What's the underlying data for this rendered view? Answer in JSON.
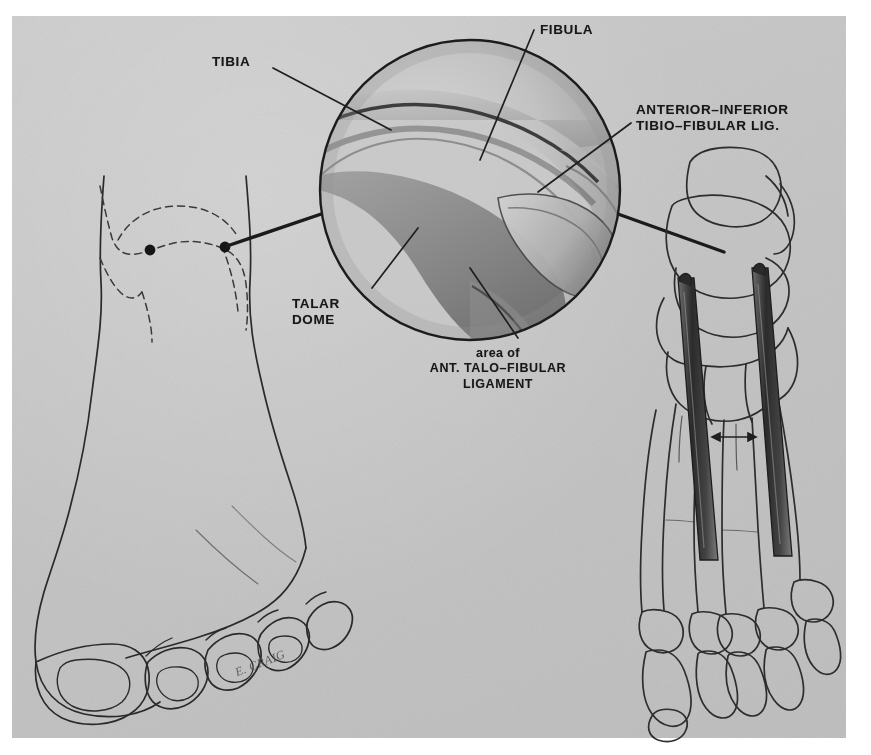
{
  "figure": {
    "kind": "medical-illustration",
    "background_color": "#c6c6c6",
    "page_color": "#ffffff",
    "ink_color": "#171717"
  },
  "labels": {
    "tibia": "TIBIA",
    "fibula": "FIBULA",
    "antinf_line1": "ANTERIOR–INFERIOR",
    "antinf_line2": "TIBIO–FIBULAR  LIG.",
    "talar_line1": "TALAR",
    "talar_line2": "DOME",
    "area_line1": "area of",
    "area_line2": "ANT. TALO–FIBULAR",
    "area_line3": "LIGAMENT"
  },
  "signature": {
    "text": "E. CRAIG"
  },
  "panels": {
    "left_foot": {
      "name": "surface-anatomy-foot",
      "description": "Dorsal view of left foot with dashed ankle landmarks and two portal dots"
    },
    "inset_circle": {
      "name": "arthroscopic-view",
      "center_x": 470,
      "center_y": 190,
      "radius": 152,
      "description": "Magnified arthroscopic view of anterolateral ankle joint"
    },
    "right_foot": {
      "name": "skeletal-foot",
      "description": "Skeletal dorsal foot with two instrument rods entering the ankle joint"
    }
  },
  "markers": {
    "portal_medial": {
      "x": 150,
      "y": 250
    },
    "portal_lateral": {
      "x": 225,
      "y": 247
    }
  }
}
